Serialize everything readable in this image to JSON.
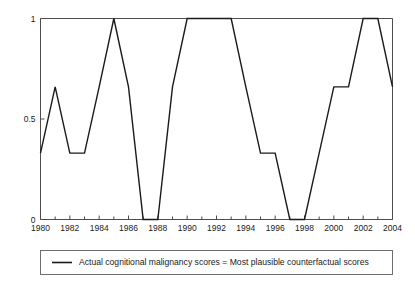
{
  "chart_data": {
    "type": "line",
    "title": "",
    "subtitle": "",
    "xlabel": "",
    "ylabel": "",
    "xlim": [
      1980,
      2004
    ],
    "ylim": [
      0,
      1
    ],
    "grid": false,
    "legend_position": "bottom",
    "x": [
      1980,
      1981,
      1982,
      1983,
      1984,
      1985,
      1986,
      1987,
      1988,
      1989,
      1990,
      1991,
      1992,
      1993,
      1994,
      1995,
      1996,
      1997,
      1998,
      1999,
      2000,
      2001,
      2002,
      2003,
      2004
    ],
    "series": [
      {
        "name": "Actual cognitional malignancy scores = Most plausible counterfactual scores",
        "color": "#1a1a1a",
        "values": [
          0.33,
          0.66,
          0.33,
          0.33,
          0.66,
          1.0,
          0.66,
          0.0,
          0.0,
          0.66,
          1.0,
          1.0,
          1.0,
          1.0,
          0.66,
          0.33,
          0.33,
          0.0,
          0.0,
          0.33,
          0.66,
          0.66,
          1.0,
          1.0,
          0.66
        ]
      }
    ],
    "x_tick_values": [
      1980,
      1981,
      1982,
      1983,
      1984,
      1985,
      1986,
      1987,
      1988,
      1989,
      1990,
      1991,
      1992,
      1993,
      1994,
      1995,
      1996,
      1997,
      1998,
      1999,
      2000,
      2001,
      2002,
      2003,
      2004
    ],
    "x_tick_labels": [
      "1980",
      "",
      "1982",
      "",
      "1984",
      "",
      "1986",
      "",
      "1988",
      "",
      "1990",
      "",
      "1992",
      "",
      "1994",
      "",
      "1996",
      "",
      "1998",
      "",
      "2000",
      "",
      "2002",
      "",
      "2004"
    ],
    "y_tick_values": [
      0,
      0.5,
      1
    ],
    "y_tick_labels": [
      "0",
      "0.5",
      "1"
    ]
  },
  "legend": {
    "entries": [
      {
        "label": "Actual cognitional malignancy scores = Most plausible counterfactual scores",
        "color": "#1a1a1a"
      }
    ]
  },
  "colors": {
    "series": "#1a1a1a",
    "axis": "#4d4d4d",
    "legend_border": "#6e6e6e",
    "background": "#ffffff"
  }
}
